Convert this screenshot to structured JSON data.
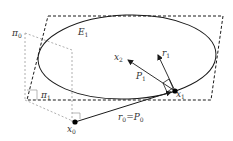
{
  "diagram": {
    "type": "geometric-figure",
    "colors": {
      "background": "#ffffff",
      "stroke": "#1a1a1a",
      "dashed_plane": "#1a1a1a",
      "aux_plane": "#9a9a9a",
      "text": "#333333"
    },
    "labels": {
      "pi0": {
        "base": "π",
        "sub": "0"
      },
      "pi1": {
        "base": "π",
        "sub": "1"
      },
      "E1": {
        "base": "E",
        "sub": "1"
      },
      "x2": {
        "base": "x",
        "sub": "2"
      },
      "r1": {
        "base": "r",
        "sub": "1"
      },
      "P1": {
        "base": "P",
        "sub": "1"
      },
      "x1": {
        "base": "x",
        "sub": "1"
      },
      "x0": {
        "base": "x",
        "sub": "0"
      },
      "r0": {
        "base": "r",
        "sub": "0"
      },
      "equals": "=",
      "P0": {
        "base": "P",
        "sub": "0"
      }
    },
    "points": [
      {
        "name": "x0",
        "x": 75,
        "y": 122
      },
      {
        "name": "x1",
        "x": 175,
        "y": 91
      }
    ],
    "vectors": [
      {
        "name": "r0=P0",
        "from": "x0",
        "to": "x1"
      },
      {
        "name": "P1",
        "from": "x1",
        "direction": "x2"
      },
      {
        "name": "r1",
        "from": "x1",
        "direction": "up"
      }
    ]
  }
}
